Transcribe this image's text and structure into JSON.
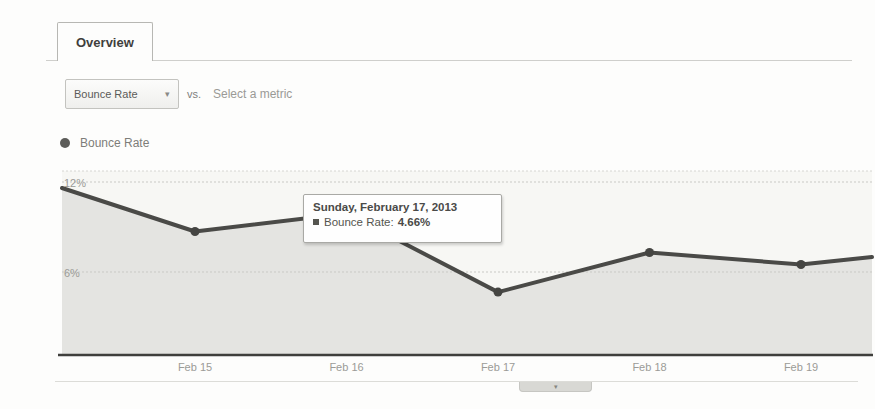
{
  "tabs": {
    "overview_label": "Overview"
  },
  "controls": {
    "metric_dropdown": {
      "label": "Bounce Rate",
      "arrow_icon": "▾"
    },
    "vs_label": "vs.",
    "select_metric_label": "Select a metric"
  },
  "legend": {
    "series_label": "Bounce Rate"
  },
  "tooltip": {
    "title": "Sunday, February 17, 2013",
    "series_label": "Bounce Rate:",
    "value": "4.66%"
  },
  "collapse_handle": {
    "chevron_icon": "▾"
  },
  "colors": {
    "line": "#4a4a47",
    "marker": "#454542",
    "area_fill": "#e4e4e1",
    "plot_bg": "#f7f7f4",
    "grid": "#c9c9c5",
    "axis": "#3f3f3c",
    "tick_text": "#9b9b97"
  },
  "chart_data": {
    "type": "area",
    "title": "Bounce Rate",
    "xlabel": "",
    "ylabel": "Bounce Rate (%)",
    "ylim": [
      0,
      13
    ],
    "grid": "horizontal-dotted",
    "legend_position": "top-left",
    "x_tick_labels": [
      "Feb 15",
      "Feb 16",
      "Feb 17",
      "Feb 18",
      "Feb 19"
    ],
    "y_ticks": [
      {
        "label": "12%",
        "value": 12
      },
      {
        "label": "6%",
        "value": 6
      }
    ],
    "series": [
      {
        "name": "Bounce Rate",
        "points": [
          {
            "label": "",
            "value": 11.6,
            "marker": false
          },
          {
            "label": "Feb 15",
            "value": 8.7,
            "marker": true
          },
          {
            "label": "Feb 16",
            "value": 9.9,
            "marker": true
          },
          {
            "label": "Feb 17",
            "value": 4.66,
            "marker": true
          },
          {
            "label": "Feb 18",
            "value": 7.3,
            "marker": true
          },
          {
            "label": "Feb 19",
            "value": 6.5,
            "marker": true
          },
          {
            "label": "",
            "value": 7.0,
            "marker": false
          }
        ]
      }
    ],
    "highlighted_point": {
      "date": "Sunday, February 17, 2013",
      "series": "Bounce Rate",
      "value_pct": 4.66
    }
  }
}
